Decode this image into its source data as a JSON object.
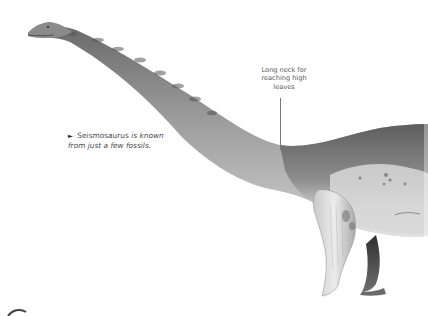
{
  "illustration": {
    "subject": "Seismosaurus",
    "icon": "sauropod-dinosaur-illustration",
    "colors": {
      "skin_dark": "#5f5f5f",
      "skin_mid": "#9a9a9a",
      "skin_light": "#dcdcdc",
      "background": "#ffffff"
    }
  },
  "annotation": {
    "lines": [
      "Long neck for",
      "reaching high",
      "leaves"
    ]
  },
  "caption": {
    "arrow": "►",
    "name": "Seismosaurus",
    "rest_line1": "is known",
    "line2": "from just a few fossils."
  }
}
